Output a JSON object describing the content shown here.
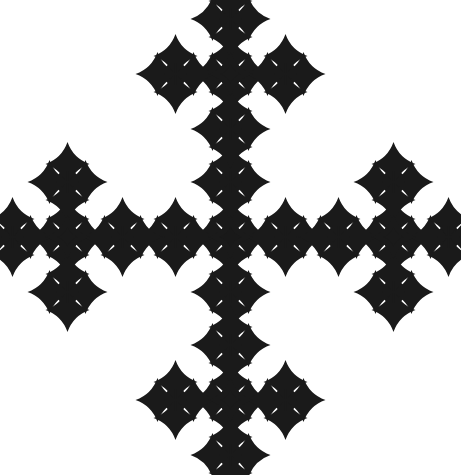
{
  "image": {
    "title": "Recursive Cross Fractal",
    "width": 461,
    "height": 475,
    "background_color": "#ffffff",
    "ink_color": "#1a1a1a"
  },
  "chart_data": {
    "type": "scatter",
    "subtitle": "Vicsek-type quincunx point set rendered with star glyphs",
    "xlabel": "",
    "ylabel": "",
    "xlim": [
      0,
      461
    ],
    "ylim": [
      0,
      475
    ],
    "grid": false,
    "legend": null,
    "annotations": [],
    "generator": {
      "rule": "quincunx",
      "description": "Each node spawns a center plus four axis-aligned children at the current step distance; repeated for 3 levels with a shrink factor.",
      "origin_x": 230.5,
      "origin_y": 237.0,
      "levels": 3,
      "step_sequence": [
        163,
        55,
        18
      ],
      "offsets_unit": [
        [
          0,
          0
        ],
        [
          1,
          0
        ],
        [
          -1,
          0
        ],
        [
          0,
          1
        ],
        [
          0,
          -1
        ]
      ],
      "glyph_by_level": [
        "star4",
        "plus",
        "dot"
      ],
      "size_by_level": [
        22,
        11,
        4.2
      ],
      "opacity_by_level": [
        1.0,
        0.92,
        0.72
      ],
      "node_counts_by_level": [
        5,
        25,
        125
      ],
      "total_points": 125
    },
    "level_nodes": {
      "level_0_count": 5,
      "level_0_points": [
        [
          230.5,
          237.0
        ],
        [
          393.5,
          237.0
        ],
        [
          67.5,
          237.0
        ],
        [
          230.5,
          400.0
        ],
        [
          230.5,
          74.0
        ]
      ],
      "level_1_count": 25,
      "level_1_step": 55,
      "level_2_count": 125,
      "level_2_step": 18
    },
    "clusters": [
      {
        "name": "top-left",
        "center_x": 47,
        "center_y": 82
      },
      {
        "name": "top-center",
        "center_x": 230,
        "center_y": 127
      },
      {
        "name": "top-right",
        "center_x": 408,
        "center_y": 78
      },
      {
        "name": "mid-left",
        "center_x": 76,
        "center_y": 232
      },
      {
        "name": "mid-left-core",
        "center_x": 120,
        "center_y": 230
      },
      {
        "name": "mid-center",
        "center_x": 230,
        "center_y": 237
      },
      {
        "name": "mid-right",
        "center_x": 345,
        "center_y": 222
      },
      {
        "name": "mid-far-right",
        "center_x": 385,
        "center_y": 222
      },
      {
        "name": "bottom-center",
        "center_x": 232,
        "center_y": 297
      },
      {
        "name": "bottom-left",
        "center_x": 53,
        "center_y": 404
      },
      {
        "name": "bottom-right",
        "center_x": 412,
        "center_y": 404
      }
    ]
  }
}
